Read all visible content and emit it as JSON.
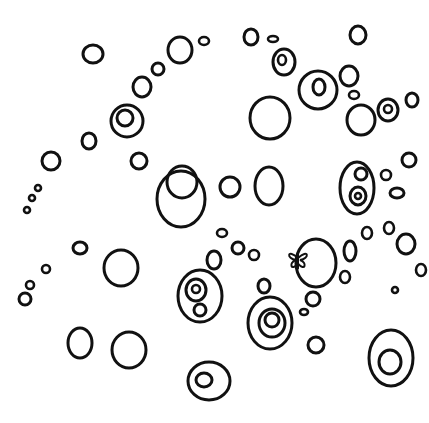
{
  "image": {
    "description": "Black line drawing of scattered hand-drawn circles and bubbles on white, some concentric, with a small hidden butterfly inside one circle",
    "stroke_color": "#111111",
    "background": "#ffffff"
  },
  "circles": [
    {
      "cx": 93,
      "cy": 54,
      "rx": 10,
      "ry": 9
    },
    {
      "cx": 180,
      "cy": 50,
      "rx": 12,
      "ry": 13
    },
    {
      "cx": 204,
      "cy": 41,
      "rx": 5,
      "ry": 4
    },
    {
      "cx": 158,
      "cy": 69,
      "rx": 6,
      "ry": 6
    },
    {
      "cx": 142,
      "cy": 87,
      "rx": 9,
      "ry": 10
    },
    {
      "cx": 127,
      "cy": 121,
      "rx": 16,
      "ry": 16
    },
    {
      "cx": 125,
      "cy": 118,
      "rx": 8,
      "ry": 8
    },
    {
      "cx": 89,
      "cy": 141,
      "rx": 7,
      "ry": 8
    },
    {
      "cx": 139,
      "cy": 161,
      "rx": 8,
      "ry": 8
    },
    {
      "cx": 51,
      "cy": 161,
      "rx": 9,
      "ry": 9
    },
    {
      "cx": 38,
      "cy": 188,
      "rx": 3,
      "ry": 3
    },
    {
      "cx": 32,
      "cy": 198,
      "rx": 3,
      "ry": 3
    },
    {
      "cx": 27,
      "cy": 210,
      "rx": 3,
      "ry": 3
    },
    {
      "cx": 251,
      "cy": 37,
      "rx": 7,
      "ry": 8
    },
    {
      "cx": 273,
      "cy": 39,
      "rx": 5,
      "ry": 3
    },
    {
      "cx": 284,
      "cy": 62,
      "rx": 11,
      "ry": 13
    },
    {
      "cx": 282,
      "cy": 60,
      "rx": 4,
      "ry": 5
    },
    {
      "cx": 358,
      "cy": 35,
      "rx": 8,
      "ry": 9
    },
    {
      "cx": 318,
      "cy": 90,
      "rx": 19,
      "ry": 19
    },
    {
      "cx": 319,
      "cy": 87,
      "rx": 6,
      "ry": 8
    },
    {
      "cx": 349,
      "cy": 76,
      "rx": 9,
      "ry": 10
    },
    {
      "cx": 354,
      "cy": 95,
      "rx": 5,
      "ry": 4
    },
    {
      "cx": 270,
      "cy": 118,
      "rx": 20,
      "ry": 21
    },
    {
      "cx": 361,
      "cy": 120,
      "rx": 14,
      "ry": 15
    },
    {
      "cx": 388,
      "cy": 110,
      "rx": 10,
      "ry": 11
    },
    {
      "cx": 388,
      "cy": 109,
      "rx": 4,
      "ry": 4
    },
    {
      "cx": 412,
      "cy": 100,
      "rx": 6,
      "ry": 7
    },
    {
      "cx": 409,
      "cy": 160,
      "rx": 7,
      "ry": 7
    },
    {
      "cx": 182,
      "cy": 182,
      "rx": 15,
      "ry": 16
    },
    {
      "cx": 181,
      "cy": 199,
      "rx": 24,
      "ry": 28
    },
    {
      "cx": 230,
      "cy": 187,
      "rx": 10,
      "ry": 10
    },
    {
      "cx": 269,
      "cy": 186,
      "rx": 14,
      "ry": 19
    },
    {
      "cx": 357,
      "cy": 188,
      "rx": 17,
      "ry": 26
    },
    {
      "cx": 361,
      "cy": 174,
      "rx": 6,
      "ry": 6
    },
    {
      "cx": 358,
      "cy": 196,
      "rx": 8,
      "ry": 9
    },
    {
      "cx": 358,
      "cy": 196,
      "rx": 3,
      "ry": 3
    },
    {
      "cx": 386,
      "cy": 175,
      "rx": 5,
      "ry": 5
    },
    {
      "cx": 397,
      "cy": 193,
      "rx": 7,
      "ry": 5
    },
    {
      "cx": 222,
      "cy": 233,
      "rx": 5,
      "ry": 4
    },
    {
      "cx": 238,
      "cy": 248,
      "rx": 6,
      "ry": 6
    },
    {
      "cx": 254,
      "cy": 255,
      "rx": 5,
      "ry": 5
    },
    {
      "cx": 214,
      "cy": 260,
      "rx": 7,
      "ry": 9
    },
    {
      "cx": 316,
      "cy": 263,
      "rx": 20,
      "ry": 24
    },
    {
      "cx": 350,
      "cy": 251,
      "rx": 6,
      "ry": 10
    },
    {
      "cx": 367,
      "cy": 233,
      "rx": 5,
      "ry": 6
    },
    {
      "cx": 389,
      "cy": 228,
      "rx": 5,
      "ry": 6
    },
    {
      "cx": 406,
      "cy": 244,
      "rx": 9,
      "ry": 10
    },
    {
      "cx": 421,
      "cy": 270,
      "rx": 5,
      "ry": 6
    },
    {
      "cx": 345,
      "cy": 277,
      "rx": 5,
      "ry": 6
    },
    {
      "cx": 395,
      "cy": 290,
      "rx": 3,
      "ry": 3
    },
    {
      "cx": 80,
      "cy": 248,
      "rx": 7,
      "ry": 6
    },
    {
      "cx": 121,
      "cy": 268,
      "rx": 17,
      "ry": 18
    },
    {
      "cx": 46,
      "cy": 269,
      "rx": 4,
      "ry": 4
    },
    {
      "cx": 30,
      "cy": 285,
      "rx": 4,
      "ry": 4
    },
    {
      "cx": 25,
      "cy": 299,
      "rx": 6,
      "ry": 6
    },
    {
      "cx": 200,
      "cy": 296,
      "rx": 22,
      "ry": 26
    },
    {
      "cx": 196,
      "cy": 290,
      "rx": 10,
      "ry": 11
    },
    {
      "cx": 196,
      "cy": 289,
      "rx": 4,
      "ry": 4
    },
    {
      "cx": 200,
      "cy": 310,
      "rx": 6,
      "ry": 6
    },
    {
      "cx": 264,
      "cy": 286,
      "rx": 6,
      "ry": 7
    },
    {
      "cx": 270,
      "cy": 323,
      "rx": 22,
      "ry": 26
    },
    {
      "cx": 272,
      "cy": 323,
      "rx": 13,
      "ry": 14
    },
    {
      "cx": 272,
      "cy": 320,
      "rx": 7,
      "ry": 7
    },
    {
      "cx": 313,
      "cy": 299,
      "rx": 7,
      "ry": 7
    },
    {
      "cx": 304,
      "cy": 312,
      "rx": 4,
      "ry": 3
    },
    {
      "cx": 316,
      "cy": 345,
      "rx": 8,
      "ry": 8
    },
    {
      "cx": 80,
      "cy": 343,
      "rx": 12,
      "ry": 15
    },
    {
      "cx": 129,
      "cy": 350,
      "rx": 17,
      "ry": 18
    },
    {
      "cx": 391,
      "cy": 358,
      "rx": 22,
      "ry": 28
    },
    {
      "cx": 390,
      "cy": 362,
      "rx": 11,
      "ry": 12
    },
    {
      "cx": 209,
      "cy": 381,
      "rx": 21,
      "ry": 19
    },
    {
      "cx": 204,
      "cy": 380,
      "rx": 8,
      "ry": 7
    }
  ],
  "butterfly": {
    "cx": 298,
    "cy": 260,
    "size": 12
  }
}
